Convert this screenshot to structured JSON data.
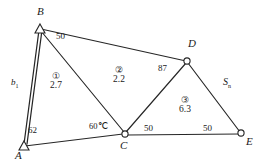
{
  "figure": {
    "kind": "survey-triangulation-network",
    "stroke_color": "#262626",
    "background": "#ffffff"
  },
  "vertices": [
    {
      "id": "A",
      "label": "A",
      "marker": "triangle",
      "x": 22,
      "y": 146,
      "label_x": 17,
      "label_y": 152
    },
    {
      "id": "B",
      "label": "B",
      "marker": "triangle",
      "x": 38,
      "y": 28,
      "label_x": 37,
      "label_y": 8
    },
    {
      "id": "C",
      "label": "C",
      "marker": "circle",
      "x": 124,
      "y": 134,
      "label_x": 120,
      "label_y": 140
    },
    {
      "id": "D",
      "label": "D",
      "marker": "circle",
      "x": 187,
      "y": 61,
      "label_x": 188,
      "label_y": 41
    },
    {
      "id": "E",
      "label": "E",
      "marker": "circle",
      "x": 241,
      "y": 134,
      "label_x": 245,
      "label_y": 139
    }
  ],
  "edges": [
    {
      "from": "A",
      "to": "B",
      "name": "edge-ab"
    },
    {
      "from": "B",
      "to": "D",
      "name": "edge-bd"
    },
    {
      "from": "B",
      "to": "C",
      "name": "edge-bc"
    },
    {
      "from": "A",
      "to": "C",
      "name": "edge-ac"
    },
    {
      "from": "C",
      "to": "D",
      "name": "edge-cd"
    },
    {
      "from": "C",
      "to": "E",
      "name": "edge-ce"
    },
    {
      "from": "D",
      "to": "E",
      "name": "edge-de"
    }
  ],
  "baseline": {
    "label": "b",
    "subscript": "1",
    "x": 13,
    "y": 82
  },
  "side_label": {
    "label": "S",
    "subscript": "n",
    "x": 224,
    "y": 81
  },
  "distance_labels": [
    {
      "name": "dist-bd",
      "text": "50",
      "x": 56,
      "y": 36
    },
    {
      "name": "dist-dc",
      "text": "87",
      "x": 159,
      "y": 67
    },
    {
      "name": "dist-ab",
      "text": "62",
      "x": 29,
      "y": 129
    },
    {
      "name": "dist-ce",
      "text": "50",
      "x": 144,
      "y": 126
    },
    {
      "name": "dist-de",
      "text": "50",
      "x": 203,
      "y": 126
    }
  ],
  "angle_labels": [
    {
      "name": "angle-at-c",
      "text": "60℃",
      "x": 91,
      "y": 124
    }
  ],
  "triangles": [
    {
      "name": "triangle-region-1",
      "id": "①",
      "value": "2.7",
      "x": 53,
      "y": 76
    },
    {
      "name": "triangle-region-2",
      "id": "②",
      "value": "2.2",
      "x": 116,
      "y": 70
    },
    {
      "name": "triangle-region-3",
      "id": "③",
      "value": "6.3",
      "x": 182,
      "y": 100
    }
  ]
}
